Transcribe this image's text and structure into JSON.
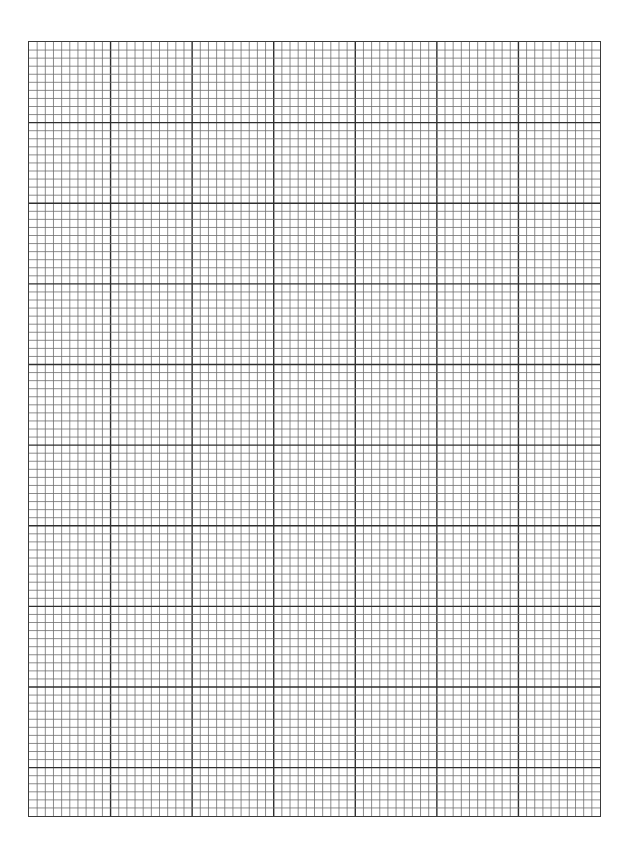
{
  "page": {
    "type": "graph-paper",
    "background_color": "#ffffff"
  },
  "grid": {
    "left": 28,
    "top": 41,
    "width": 573,
    "height": 776,
    "columns": 70,
    "rows": 96,
    "major_every": 10,
    "minor_line_color": "#6e6e6e",
    "major_line_color": "#2e2e2e",
    "border_color": "#3a3a3a"
  }
}
